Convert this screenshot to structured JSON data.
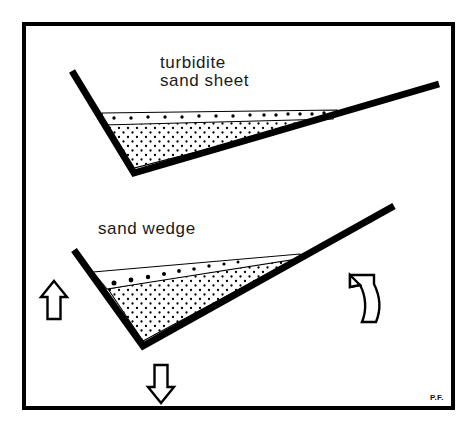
{
  "figure": {
    "title_top": "turbidite",
    "title_top_line2": "sand  sheet",
    "title_bottom": "sand  wedge",
    "signature": "P.F.",
    "background_color": "#ffffff",
    "ink_color": "#000000",
    "frame": {
      "name": "figure-border",
      "x": 22,
      "y": 22,
      "width": 433,
      "height": 388,
      "stroke_width": 4,
      "color": "#000000"
    }
  },
  "panels": [
    {
      "id": "turbidite-sand-sheet",
      "label_lines": [
        "turbidite",
        "sand  sheet"
      ],
      "label_x": 160,
      "label_y_line1": 68,
      "label_y_line2": 86,
      "basin": {
        "left_top": [
          72,
          71
        ],
        "bottom": [
          134,
          173
        ],
        "right_top": [
          439,
          84
        ],
        "stroke_width": 7
      },
      "sand_body": {
        "type": "sheet",
        "description": "flat-topped stippled sand sheet filling basin floor",
        "fill_pattern": "stipple-dense",
        "points": "104,124 332,117 134,168"
      },
      "dotted_band": {
        "description": "thin dotted layer above sand sheet",
        "points": "102,113 337,110 333,119 104,125",
        "dot_count": 15,
        "dot_radius": 1.7
      }
    },
    {
      "id": "sand-wedge",
      "label_lines": [
        "sand  wedge"
      ],
      "label_x": 98,
      "label_y_line1": 234,
      "basin": {
        "left_top": [
          74,
          250
        ],
        "bottom": [
          143,
          346
        ],
        "right_top": [
          394,
          206
        ],
        "stroke_width": 7
      },
      "sand_body": {
        "type": "wedge",
        "description": "stippled wedge thickening toward the right basin flank",
        "fill_pattern": "stipple-dense",
        "points": "108,289 303,255 143,341"
      },
      "dotted_band": {
        "description": "thin dotted layer tapering to the right above the wedge",
        "points": "93,272 300,254 303,258 107,289",
        "dot_count": 9,
        "dot_radius": 2.3
      }
    }
  ],
  "motion_arrows": [
    {
      "name": "uplift-arrow-left",
      "direction": "up",
      "meaning": "uplift",
      "x": 54,
      "y": 300,
      "size": 40
    },
    {
      "name": "subsidence-arrow-bottom",
      "direction": "down",
      "meaning": "subsidence",
      "x": 161,
      "y": 386,
      "size": 40
    },
    {
      "name": "tilting-arrow-right",
      "direction": "curved-up",
      "meaning": "tilting / rotation",
      "x": 362,
      "y": 295,
      "size": 44
    }
  ]
}
